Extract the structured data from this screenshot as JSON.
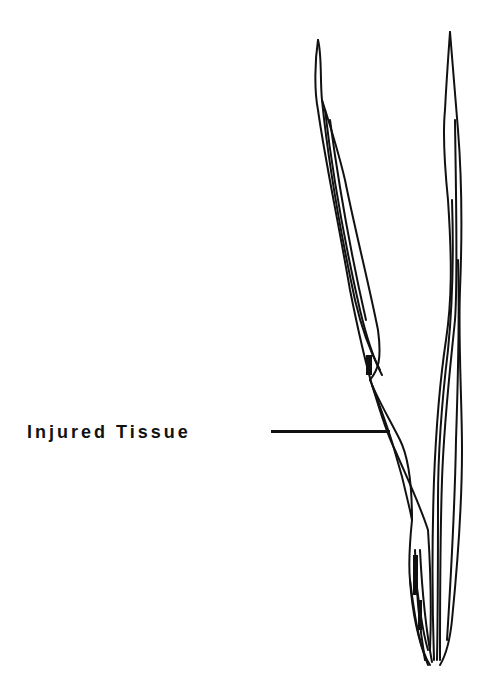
{
  "diagram": {
    "labels": [
      {
        "text": "Injured Tissue",
        "points_to": "left leaf blade constriction"
      }
    ]
  },
  "colors": {
    "ink": "#111111",
    "background": "#ffffff"
  }
}
